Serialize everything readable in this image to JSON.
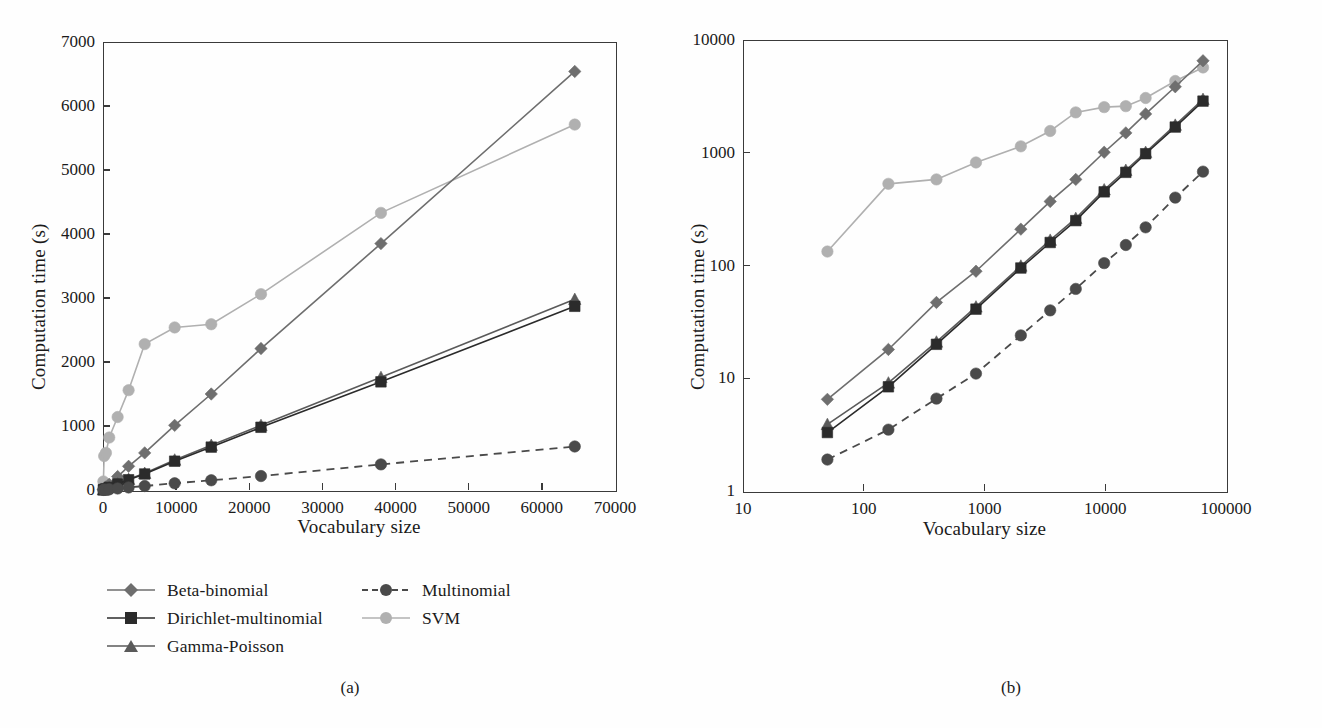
{
  "figure": {
    "panels": [
      {
        "id": "a",
        "caption": "(a)",
        "xlabel": "Vocabulary size",
        "ylabel": "Computation time (s)"
      },
      {
        "id": "b",
        "caption": "(b)",
        "xlabel": "Vocabulary size",
        "ylabel": "Computation time (s)"
      }
    ]
  },
  "legend": {
    "column_1": [
      {
        "label": "Beta-binomial",
        "marker": "diamond-marker",
        "color": "#6e6e6e",
        "dashed": false
      },
      {
        "label": "Dirichlet-multinomial",
        "marker": "square-marker",
        "color": "#2b2b2b",
        "dashed": false
      },
      {
        "label": "Gamma-Poisson",
        "marker": "triangle-marker",
        "color": "#5a5a5a",
        "dashed": false
      }
    ],
    "column_2": [
      {
        "label": "Multinomial",
        "marker": "circle-marker",
        "color": "#4a4a4a",
        "dashed": true
      },
      {
        "label": "SVM",
        "marker": "circle-marker",
        "color": "#b0b0b0",
        "dashed": false
      }
    ]
  },
  "chart_data": [
    {
      "type": "line",
      "panel": "a",
      "title": "",
      "xlabel": "Vocabulary size",
      "ylabel": "Computation time (s)",
      "xscale": "linear",
      "yscale": "linear",
      "xlim": [
        0,
        70000
      ],
      "ylim": [
        0,
        7000
      ],
      "xticks": [
        0,
        10000,
        20000,
        30000,
        40000,
        50000,
        60000,
        70000
      ],
      "xtick_labels": [
        "0",
        "10000",
        "20000",
        "30000",
        "40000",
        "50000",
        "60000",
        "70000"
      ],
      "yticks": [
        0,
        1000,
        2000,
        3000,
        4000,
        5000,
        6000,
        7000
      ],
      "ytick_labels": [
        "0",
        "1000",
        "2000",
        "3000",
        "4000",
        "5000",
        "6000",
        "7000"
      ],
      "grid": false,
      "legend_position": "below",
      "series": [
        {
          "name": "Beta-binomial",
          "color": "#6e6e6e",
          "marker": "diamond",
          "dashed": false,
          "x": [
            50,
            160,
            400,
            850,
            2000,
            3500,
            5700,
            9800,
            14800,
            21600,
            38000,
            64500
          ],
          "values": [
            6.5,
            18,
            47,
            89,
            210,
            370,
            580,
            1010,
            1500,
            2210,
            3850,
            6540
          ]
        },
        {
          "name": "Dirichlet-multinomial",
          "color": "#2b2b2b",
          "marker": "square",
          "dashed": false,
          "x": [
            50,
            160,
            400,
            850,
            2000,
            3500,
            5700,
            9800,
            14800,
            21600,
            38000,
            64500
          ],
          "values": [
            3.3,
            8.4,
            20,
            41,
            95,
            160,
            250,
            450,
            670,
            980,
            1690,
            2870
          ]
        },
        {
          "name": "Gamma-Poisson",
          "color": "#5a5a5a",
          "marker": "triangle",
          "dashed": false,
          "x": [
            50,
            160,
            400,
            850,
            2000,
            3500,
            5700,
            9800,
            14800,
            21600,
            38000,
            64500
          ],
          "values": [
            3.9,
            9.1,
            21,
            43,
            99,
            168,
            262,
            470,
            700,
            1010,
            1760,
            2980
          ]
        },
        {
          "name": "Multinomial",
          "color": "#4a4a4a",
          "marker": "circle",
          "dashed": true,
          "x": [
            50,
            160,
            400,
            850,
            2000,
            3500,
            5700,
            9800,
            14800,
            21600,
            38000,
            64500
          ],
          "values": [
            1.9,
            3.5,
            6.6,
            11,
            24,
            40,
            62,
            105,
            152,
            218,
            400,
            680
          ]
        },
        {
          "name": "SVM",
          "color": "#b0b0b0",
          "marker": "circle",
          "dashed": false,
          "x": [
            50,
            160,
            400,
            850,
            2000,
            3500,
            5700,
            9800,
            14800,
            21600,
            38000,
            64500
          ],
          "values": [
            133,
            530,
            580,
            820,
            1140,
            1560,
            2280,
            2540,
            2590,
            3060,
            4330,
            5710
          ]
        }
      ]
    },
    {
      "type": "line",
      "panel": "b",
      "title": "",
      "xlabel": "Vocabulary size",
      "ylabel": "Computation time (s)",
      "xscale": "log",
      "yscale": "log",
      "xlim": [
        10,
        100000
      ],
      "ylim": [
        1,
        10000
      ],
      "xticks": [
        10,
        100,
        1000,
        10000,
        100000
      ],
      "xtick_labels": [
        "10",
        "100",
        "1000",
        "10000",
        "100000"
      ],
      "yticks": [
        1,
        10,
        100,
        1000,
        10000
      ],
      "ytick_labels": [
        "1",
        "10",
        "100",
        "1000",
        "10000"
      ],
      "grid": false,
      "legend_position": "below",
      "series": [
        {
          "name": "Beta-binomial",
          "color": "#6e6e6e",
          "marker": "diamond",
          "dashed": false,
          "x": [
            50,
            160,
            400,
            850,
            2000,
            3500,
            5700,
            9800,
            14800,
            21600,
            38000,
            64500
          ],
          "values": [
            6.5,
            18,
            47,
            89,
            210,
            370,
            580,
            1010,
            1500,
            2210,
            3850,
            6540
          ]
        },
        {
          "name": "Dirichlet-multinomial",
          "color": "#2b2b2b",
          "marker": "square",
          "dashed": false,
          "x": [
            50,
            160,
            400,
            850,
            2000,
            3500,
            5700,
            9800,
            14800,
            21600,
            38000,
            64500
          ],
          "values": [
            3.3,
            8.4,
            20,
            41,
            95,
            160,
            250,
            450,
            670,
            980,
            1690,
            2870
          ]
        },
        {
          "name": "Gamma-Poisson",
          "color": "#5a5a5a",
          "marker": "triangle",
          "dashed": false,
          "x": [
            50,
            160,
            400,
            850,
            2000,
            3500,
            5700,
            9800,
            14800,
            21600,
            38000,
            64500
          ],
          "values": [
            3.9,
            9.1,
            21,
            43,
            99,
            168,
            262,
            470,
            700,
            1010,
            1760,
            2980
          ]
        },
        {
          "name": "Multinomial",
          "color": "#4a4a4a",
          "marker": "circle",
          "dashed": true,
          "x": [
            50,
            160,
            400,
            850,
            2000,
            3500,
            5700,
            9800,
            14800,
            21600,
            38000,
            64500
          ],
          "values": [
            1.9,
            3.5,
            6.6,
            11,
            24,
            40,
            62,
            105,
            152,
            218,
            400,
            680
          ]
        },
        {
          "name": "SVM",
          "color": "#b0b0b0",
          "marker": "circle",
          "dashed": false,
          "x": [
            50,
            160,
            400,
            850,
            2000,
            3500,
            5700,
            9800,
            14800,
            21600,
            38000,
            64500
          ],
          "values": [
            133,
            530,
            580,
            820,
            1140,
            1560,
            2280,
            2540,
            2590,
            3060,
            4330,
            5710
          ]
        }
      ]
    }
  ]
}
